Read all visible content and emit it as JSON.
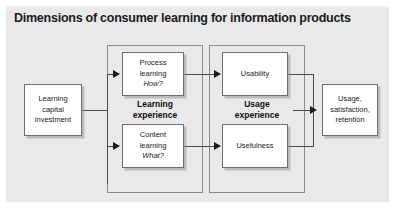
{
  "figure": {
    "title": "Dimensions of consumer learning for information products",
    "panel_color": "#e9e9e9",
    "node_fill": "#ffffff",
    "line_color": "#4a4a4a"
  },
  "nodes": {
    "investment": {
      "line1": "Learning",
      "line2": "capital",
      "line3": "investment"
    },
    "process": {
      "line1": "Process",
      "line2": "learning",
      "line3": "How?"
    },
    "content": {
      "line1": "Content",
      "line2": "learning",
      "line3": "What?"
    },
    "usability": {
      "line1": "Usability"
    },
    "usefulness": {
      "line1": "Usefulness"
    },
    "outcome": {
      "line1": "Usage,",
      "line2": "satisfaction,",
      "line3": "retention"
    }
  },
  "groups": {
    "learning": {
      "line1": "Learning",
      "line2": "experience"
    },
    "usage": {
      "line1": "Usage",
      "line2": "experience"
    }
  }
}
